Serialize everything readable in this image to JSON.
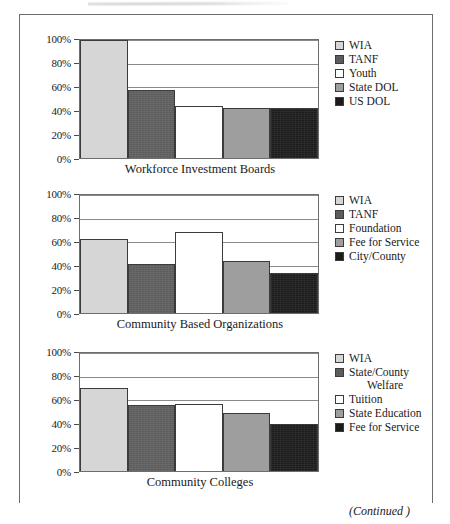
{
  "figure": {
    "continued_label": "(Continued )",
    "y_axis_ticks": [
      "100%",
      "80%",
      "60%",
      "40%",
      "20%",
      "0%"
    ],
    "colors": {
      "wia": "#d6d6d6",
      "dark_gray": "#5c5c5c",
      "white": "#ffffff",
      "mid_gray": "#9e9e9e",
      "black": "#1b1b1b",
      "frame": "#6d6d6d",
      "gridline": "#8a8a8a"
    }
  },
  "chart_data": [
    {
      "type": "bar",
      "title": "Workforce Investment Boards",
      "xlabel": "Workforce Investment Boards",
      "ylabel": "",
      "ylim": [
        0,
        100
      ],
      "yticks": [
        0,
        20,
        40,
        60,
        80,
        100
      ],
      "ytick_labels": [
        "0%",
        "20%",
        "40%",
        "60%",
        "80%",
        "100%"
      ],
      "grid": true,
      "legend_position": "right",
      "categories": [
        "WIA",
        "TANF",
        "Youth",
        "State DOL",
        "US DOL"
      ],
      "values": [
        100,
        58,
        44.5,
        42.5,
        42
      ],
      "colors": [
        "#d6d6d6",
        "#5c5c5c",
        "#ffffff",
        "#9e9e9e",
        "#1b1b1b"
      ]
    },
    {
      "type": "bar",
      "title": "Community Based Organizations",
      "xlabel": "Community Based Organizations",
      "ylabel": "",
      "ylim": [
        0,
        100
      ],
      "yticks": [
        0,
        20,
        40,
        60,
        80,
        100
      ],
      "ytick_labels": [
        "0%",
        "20%",
        "40%",
        "60%",
        "80%",
        "100%"
      ],
      "grid": true,
      "legend_position": "right",
      "categories": [
        "WIA",
        "TANF",
        "Foundation",
        "Fee for Service",
        "City/County"
      ],
      "values": [
        62.5,
        41.5,
        68.5,
        44.5,
        33.5
      ],
      "colors": [
        "#d6d6d6",
        "#5c5c5c",
        "#ffffff",
        "#9e9e9e",
        "#1b1b1b"
      ]
    },
    {
      "type": "bar",
      "title": "Community Colleges",
      "xlabel": "Community Colleges",
      "ylabel": "",
      "ylim": [
        0,
        100
      ],
      "yticks": [
        0,
        20,
        40,
        60,
        80,
        100
      ],
      "ytick_labels": [
        "0%",
        "20%",
        "40%",
        "60%",
        "80%",
        "100%"
      ],
      "grid": true,
      "legend_position": "right",
      "categories": [
        "WIA",
        "State/County Welfare",
        "Tuition",
        "State Education",
        "Fee for Service"
      ],
      "values": [
        70.5,
        56,
        56.5,
        49.5,
        40
      ],
      "colors": [
        "#d6d6d6",
        "#5c5c5c",
        "#ffffff",
        "#9e9e9e",
        "#1b1b1b"
      ]
    }
  ],
  "panels": [
    {
      "caption": "Workforce Investment Boards",
      "legend": [
        {
          "label": "WIA",
          "color": "#d6d6d6"
        },
        {
          "label": "TANF",
          "color": "#5c5c5c"
        },
        {
          "label": "Youth",
          "color": "#ffffff"
        },
        {
          "label": "State DOL",
          "color": "#9e9e9e"
        },
        {
          "label": "US DOL",
          "color": "#1b1b1b"
        }
      ]
    },
    {
      "caption": "Community Based Organizations",
      "legend": [
        {
          "label": "WIA",
          "color": "#d6d6d6"
        },
        {
          "label": "TANF",
          "color": "#5c5c5c"
        },
        {
          "label": "Foundation",
          "color": "#ffffff"
        },
        {
          "label": "Fee for Service",
          "color": "#9e9e9e"
        },
        {
          "label": "City/County",
          "color": "#1b1b1b"
        }
      ]
    },
    {
      "caption": "Community Colleges",
      "legend": [
        {
          "label": "WIA",
          "color": "#d6d6d6"
        },
        {
          "label": "State/County",
          "label2": "Welfare",
          "color": "#5c5c5c"
        },
        {
          "label": "Tuition",
          "color": "#ffffff"
        },
        {
          "label": "State Education",
          "color": "#9e9e9e"
        },
        {
          "label": "Fee for Service",
          "color": "#1b1b1b"
        }
      ]
    }
  ]
}
